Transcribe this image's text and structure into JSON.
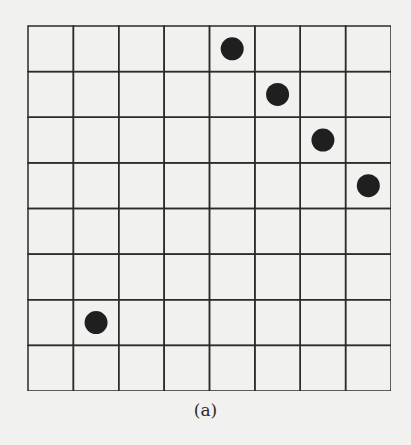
{
  "figure": {
    "caption": "(a)",
    "grid": {
      "rows": 8,
      "cols": 8
    },
    "line_color": "#2b2b2b",
    "dot_color": "#1f1f1f",
    "background": "#f1f1ef",
    "dots": [
      {
        "row": 0,
        "col": 4
      },
      {
        "row": 1,
        "col": 5
      },
      {
        "row": 2,
        "col": 6
      },
      {
        "row": 3,
        "col": 7
      },
      {
        "row": 6,
        "col": 1
      }
    ]
  }
}
